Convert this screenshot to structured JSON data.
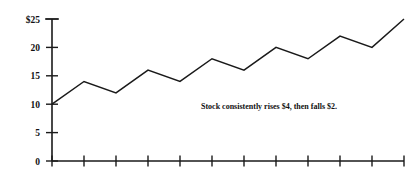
{
  "chart_data": {
    "type": "line",
    "title": "",
    "subtitle": "",
    "xlabel": "",
    "ylabel": "",
    "ylim": [
      0,
      25
    ],
    "yticks": [
      0,
      5,
      10,
      15,
      20,
      25
    ],
    "ytick_labels": [
      "0",
      "5",
      "10",
      "15",
      "20",
      "$25"
    ],
    "grid": false,
    "legend": null,
    "x": [
      1,
      2,
      3,
      4,
      5,
      6,
      7,
      8,
      9,
      10,
      11,
      12
    ],
    "xtick_labels": [
      "",
      "",
      "",
      "",
      "",
      "",
      "",
      "",
      "",
      "",
      "",
      ""
    ],
    "values": [
      10,
      14,
      12,
      16,
      14,
      18,
      16,
      20,
      18,
      22,
      20,
      25
    ],
    "series": [
      {
        "name": "Stock price",
        "values": [
          10,
          14,
          12,
          16,
          14,
          18,
          16,
          20,
          18,
          22,
          20,
          25
        ],
        "color": "#1a1a1a"
      }
    ],
    "annotations": [
      {
        "text": "Stock consistently rises $4, then falls $2.",
        "x_px": 201,
        "y_px": 109
      }
    ]
  },
  "colors": {
    "line": "#1a1a1a",
    "axis": "#1a1a1a",
    "text": "#111111",
    "background": "#ffffff"
  }
}
